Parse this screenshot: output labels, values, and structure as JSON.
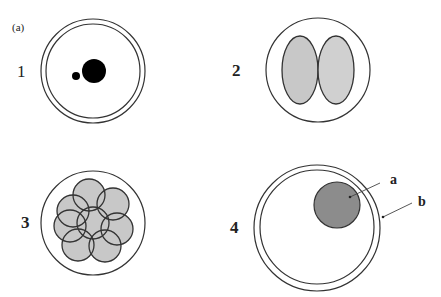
{
  "figure": {
    "tag": "(a)",
    "colors": {
      "stroke": "#333333",
      "cell_fill": "#c8c8c8",
      "nucleus_fill": "#8c8c8c",
      "dot_fill": "#000000",
      "background": "#ffffff"
    },
    "panels": [
      {
        "id": 1,
        "label": "1",
        "description": "Zygote with double membrane and two pronuclei/dots",
        "outer_circle": {
          "cx": 93,
          "cy": 71,
          "r": 52
        },
        "inner_circle": {
          "cx": 93,
          "cy": 71,
          "r": 47
        },
        "dots": [
          {
            "cx": 94,
            "cy": 71,
            "r": 12
          },
          {
            "cx": 76,
            "cy": 76,
            "r": 4
          }
        ]
      },
      {
        "id": 2,
        "label": "2",
        "description": "Two-cell stage within single membrane",
        "outer_circle": {
          "cx": 318,
          "cy": 70,
          "r": 52
        },
        "cells": [
          {
            "cx": 300,
            "cy": 70,
            "rx": 18,
            "ry": 34
          },
          {
            "cx": 336,
            "cy": 70,
            "rx": 18,
            "ry": 34
          }
        ]
      },
      {
        "id": 3,
        "label": "3",
        "description": "Multi-cell (morula) stage within single membrane",
        "outer_circle": {
          "cx": 93,
          "cy": 223,
          "r": 52
        },
        "cells": [
          {
            "cx": 89,
            "cy": 195,
            "r": 16
          },
          {
            "cx": 113,
            "cy": 204,
            "r": 16
          },
          {
            "cx": 73,
            "cy": 211,
            "r": 16
          },
          {
            "cx": 70,
            "cy": 226,
            "r": 16
          },
          {
            "cx": 117,
            "cy": 229,
            "r": 16
          },
          {
            "cx": 78,
            "cy": 245,
            "r": 16
          },
          {
            "cx": 105,
            "cy": 246,
            "r": 16
          },
          {
            "cx": 93,
            "cy": 223,
            "r": 16
          }
        ]
      },
      {
        "id": 4,
        "label": "4",
        "description": "Cell with large nucleus (a) and double membrane (b)",
        "outer_circle": {
          "cx": 317,
          "cy": 228,
          "r": 63
        },
        "inner_circle": {
          "cx": 317,
          "cy": 227,
          "r": 57
        },
        "nucleus": {
          "cx": 337,
          "cy": 205,
          "r": 23
        },
        "annotations": [
          {
            "text": "a",
            "x": 390,
            "y": 184,
            "line": {
              "x1": 380,
              "y1": 183,
              "x2": 350,
              "y2": 197
            }
          },
          {
            "text": "b",
            "x": 418,
            "y": 206,
            "line": {
              "x1": 412,
              "y1": 203,
              "x2": 383,
              "y2": 217
            }
          }
        ]
      }
    ]
  }
}
